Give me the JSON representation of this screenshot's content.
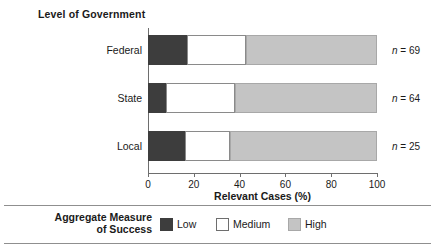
{
  "chart_data": {
    "type": "bar",
    "orientation": "horizontal",
    "stacked": true,
    "normalized_percent": true,
    "title": "Level of Government",
    "xlabel": "Relevant Cases (%)",
    "ylabel": "",
    "xlim": [
      0,
      100
    ],
    "xticks": [
      0,
      20,
      40,
      60,
      80,
      100
    ],
    "xtick_labels": [
      "0",
      "20",
      "40",
      "60",
      "80",
      "100"
    ],
    "grid": false,
    "legend_position": "bottom",
    "legend_title": "Aggregate Measure of Success",
    "categories": [
      "Federal",
      "State",
      "Local"
    ],
    "series": [
      {
        "name": "Low",
        "color": "#3d3d3d",
        "values": [
          17,
          8,
          16
        ]
      },
      {
        "name": "Medium",
        "color": "#ffffff",
        "values": [
          26,
          30,
          20
        ]
      },
      {
        "name": "High",
        "color": "#c4c4c4",
        "values": [
          57,
          62,
          64
        ]
      }
    ],
    "annotations": [
      {
        "category": "Federal",
        "text": "n = 69",
        "n": 69
      },
      {
        "category": "State",
        "text": "n = 64",
        "n": 64
      },
      {
        "category": "Local",
        "text": "n = 25",
        "n": 25
      }
    ]
  },
  "title": {
    "text": "Level of Government"
  },
  "axis": {
    "x_title": "Relevant Cases (%)",
    "ticks": [
      {
        "label": "0",
        "value": 0
      },
      {
        "label": "20",
        "value": 20
      },
      {
        "label": "40",
        "value": 40
      },
      {
        "label": "60",
        "value": 60
      },
      {
        "label": "80",
        "value": 80
      },
      {
        "label": "100",
        "value": 100
      }
    ]
  },
  "rows": [
    {
      "label": "Federal",
      "n_label": "n = 69",
      "segments": [
        {
          "name": "Low",
          "value": 17
        },
        {
          "name": "Medium",
          "value": 26
        },
        {
          "name": "High",
          "value": 57
        }
      ]
    },
    {
      "label": "State",
      "n_label": "n = 64",
      "segments": [
        {
          "name": "Low",
          "value": 8
        },
        {
          "name": "Medium",
          "value": 30
        },
        {
          "name": "High",
          "value": 62
        }
      ]
    },
    {
      "label": "Local",
      "n_label": "n = 25",
      "segments": [
        {
          "name": "Low",
          "value": 16
        },
        {
          "name": "Medium",
          "value": 20
        },
        {
          "name": "High",
          "value": 64
        }
      ]
    }
  ],
  "legend": {
    "title_line1": "Aggregate Measure",
    "title_line2": "of Success",
    "items": [
      {
        "label": "Low",
        "color": "#3d3d3d"
      },
      {
        "label": "Medium",
        "color": "#ffffff"
      },
      {
        "label": "High",
        "color": "#c4c4c4"
      }
    ]
  },
  "colors": {
    "low": "#3d3d3d",
    "medium": "#ffffff",
    "high": "#c4c4c4",
    "axis": "#6e6e6e",
    "rule": "#8f8f8f",
    "text": "#1a1a1a"
  }
}
